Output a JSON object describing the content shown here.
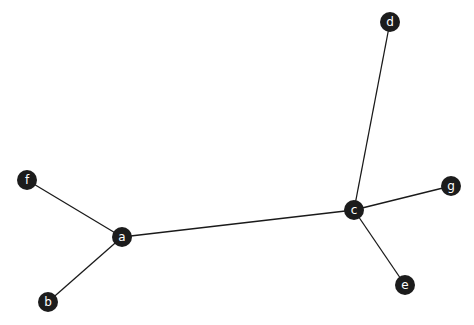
{
  "graph": {
    "nodes": [
      {
        "id": "a",
        "label": "a",
        "x": 122,
        "y": 237
      },
      {
        "id": "b",
        "label": "b",
        "x": 48,
        "y": 302
      },
      {
        "id": "c",
        "label": "c",
        "x": 354,
        "y": 210
      },
      {
        "id": "d",
        "label": "d",
        "x": 390,
        "y": 22
      },
      {
        "id": "e",
        "label": "e",
        "x": 405,
        "y": 285
      },
      {
        "id": "f",
        "label": "f",
        "x": 27,
        "y": 180
      },
      {
        "id": "g",
        "label": "g",
        "x": 451,
        "y": 186
      }
    ],
    "edges": [
      {
        "source": "a",
        "target": "f"
      },
      {
        "source": "a",
        "target": "b"
      },
      {
        "source": "a",
        "target": "c"
      },
      {
        "source": "c",
        "target": "d"
      },
      {
        "source": "c",
        "target": "g"
      },
      {
        "source": "c",
        "target": "e"
      }
    ],
    "node_radius": 10,
    "node_color": "#1c1c1c",
    "label_color": "#ffffff",
    "edge_color": "#1a1a1a"
  }
}
